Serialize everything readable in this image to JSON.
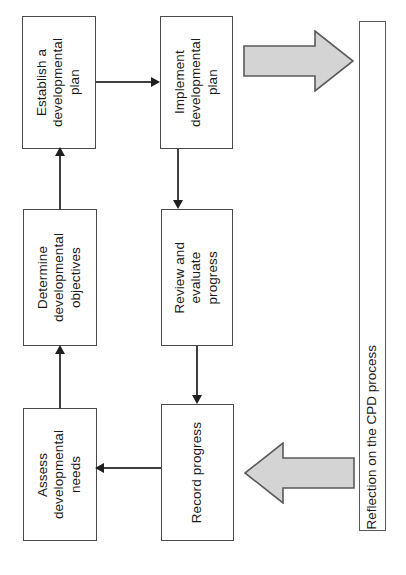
{
  "diagram": {
    "colors": {
      "box_border": "#4a4a4a",
      "box_fill": "#ffffff",
      "connector": "#3f3f3f",
      "block_arrow_fill": "#d4d4d4",
      "block_arrow_stroke": "#5a5a5a",
      "text": "#1a1a1a",
      "background": "#ffffff"
    },
    "nodes": [
      {
        "id": "establish-plan",
        "label": "Establish a\ndevelopmental\nplan"
      },
      {
        "id": "implement-plan",
        "label": "Implement\ndevelopmental\nplan"
      },
      {
        "id": "determine-objectives",
        "label": "Determine\ndevelopmental\nobjectives"
      },
      {
        "id": "review-evaluate",
        "label": "Review and\nevaluate\nprogress"
      },
      {
        "id": "assess-needs",
        "label": "Assess\ndevelopmental\nneeds"
      },
      {
        "id": "record-progress",
        "label": "Record progress"
      }
    ],
    "reflection": {
      "id": "reflection-bar",
      "label": "Reflection on the CPD process"
    },
    "connectors": [
      {
        "id": "assess-to-determine",
        "from": "assess-needs",
        "to": "determine-objectives",
        "direction": "up"
      },
      {
        "id": "determine-to-establish",
        "from": "determine-objectives",
        "to": "establish-plan",
        "direction": "up"
      },
      {
        "id": "establish-to-implement",
        "from": "establish-plan",
        "to": "implement-plan",
        "direction": "right"
      },
      {
        "id": "implement-to-review",
        "from": "implement-plan",
        "to": "review-evaluate",
        "direction": "down"
      },
      {
        "id": "review-to-record",
        "from": "review-evaluate",
        "to": "record-progress",
        "direction": "down"
      },
      {
        "id": "record-to-assess",
        "from": "record-progress",
        "to": "assess-needs",
        "direction": "left"
      }
    ],
    "block_arrows": [
      {
        "id": "to-reflection",
        "direction": "right",
        "meaning": "process feeds into reflection"
      },
      {
        "id": "from-reflection",
        "direction": "left",
        "meaning": "reflection feeds back into process"
      }
    ]
  }
}
